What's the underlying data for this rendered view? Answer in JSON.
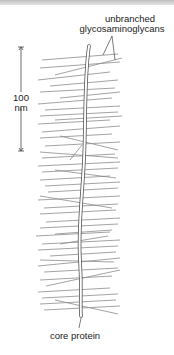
{
  "diagram": {
    "labels": {
      "gag_line1": "unbranched",
      "gag_line2": "glycosaminoglycans",
      "scale_value": "100",
      "scale_unit": "nm",
      "core": "core protein"
    },
    "colors": {
      "gag_lines": "#8a8a8a",
      "core_outline": "#555555",
      "text": "#222222"
    }
  }
}
